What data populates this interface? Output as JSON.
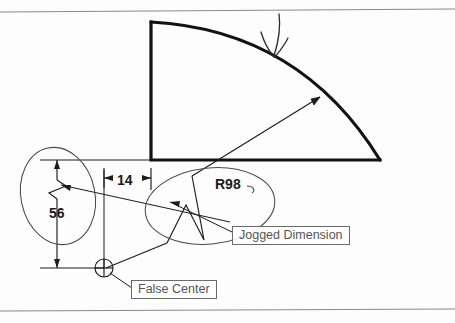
{
  "figure": {
    "type": "engineering-drawing",
    "background_color": "#fdfdfd",
    "line_color": "#111111",
    "annotation_color": "#555555"
  },
  "dimensions": {
    "radius": "R98",
    "vertical": "56",
    "horizontal": "14"
  },
  "callouts": {
    "jogged": "Jogged Dimension",
    "false_center": "False Center"
  },
  "geometry": {
    "arc_top_x": 150,
    "arc_top_y": 22,
    "arc_base_y": 160,
    "arc_right_x": 380,
    "false_center_x": 104,
    "false_center_y": 268,
    "radius_arrow_x": 320,
    "radius_arrow_y": 97
  }
}
